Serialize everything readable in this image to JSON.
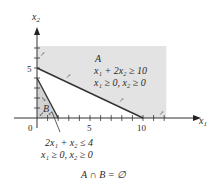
{
  "axes": {
    "x_label": "x",
    "x_sub": "1",
    "y_label": "x",
    "y_sub": "2",
    "x_ticks": [
      {
        "value": 0,
        "label": "0"
      },
      {
        "value": 5,
        "label": "5"
      },
      {
        "value": 10,
        "label": "10"
      }
    ],
    "y_ticks": [
      {
        "value": 5,
        "label": "5"
      }
    ],
    "x_range": [
      0,
      12
    ],
    "y_range": [
      0,
      7
    ]
  },
  "region_a": {
    "name": "A",
    "constraint_1": "x₁ + 2x₂ ≥ 10",
    "constraint_2": "x₁ ≥ 0, x₂ ≥ 0",
    "boundary": {
      "x_intercept": 10,
      "y_intercept": 5
    },
    "fill_color": "#e3e3e3"
  },
  "region_b": {
    "name": "B",
    "constraint_1": "2x₁ + x₂ ≤ 4",
    "constraint_2": "x₁ ≥ 0, x₂ ≥ 0",
    "boundary": {
      "x_intercept": 2,
      "y_intercept": 4
    },
    "fill_color": "#d2d2d2"
  },
  "conclusion": "A ∩ B = ∅",
  "line_color": "#333333"
}
